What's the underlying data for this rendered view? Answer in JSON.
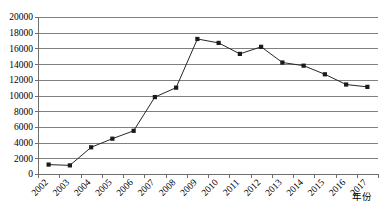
{
  "chart_data": {
    "type": "line",
    "title": "",
    "xlabel": "年份",
    "ylabel": "",
    "categories": [
      "2002",
      "2003",
      "2004",
      "2005",
      "2006",
      "2007",
      "2008",
      "2009",
      "2010",
      "2011",
      "2012",
      "2013",
      "2014",
      "2015",
      "2016",
      "2017"
    ],
    "values": [
      1200,
      1100,
      3400,
      4500,
      5500,
      9800,
      11000,
      17200,
      16700,
      15300,
      16200,
      14200,
      13800,
      12700,
      11400,
      11100
    ],
    "series": [
      {
        "name": "",
        "values": [
          1200,
          1100,
          3400,
          4500,
          5500,
          9800,
          11000,
          17200,
          16700,
          15300,
          16200,
          14200,
          13800,
          12700,
          11400,
          11100
        ]
      }
    ],
    "ylim": [
      0,
      20000
    ],
    "ytick_labels": [
      "0",
      "2000",
      "4000",
      "6000",
      "8000",
      "10000",
      "12000",
      "14000",
      "16000",
      "18000",
      "20000"
    ],
    "ytick_values": [
      0,
      2000,
      4000,
      6000,
      8000,
      10000,
      12000,
      14000,
      16000,
      18000,
      20000
    ],
    "ytick_step": 2000,
    "grid": true,
    "grid_axis": "y",
    "legend": false,
    "legend_position": "none",
    "marker": "square",
    "line_color": "#262626",
    "marker_color": "#1a1a1a",
    "grid_color": "#808080",
    "axis_color": "#6e6e6e",
    "background": "#ffffff",
    "xtick_label_rotation": 45
  }
}
